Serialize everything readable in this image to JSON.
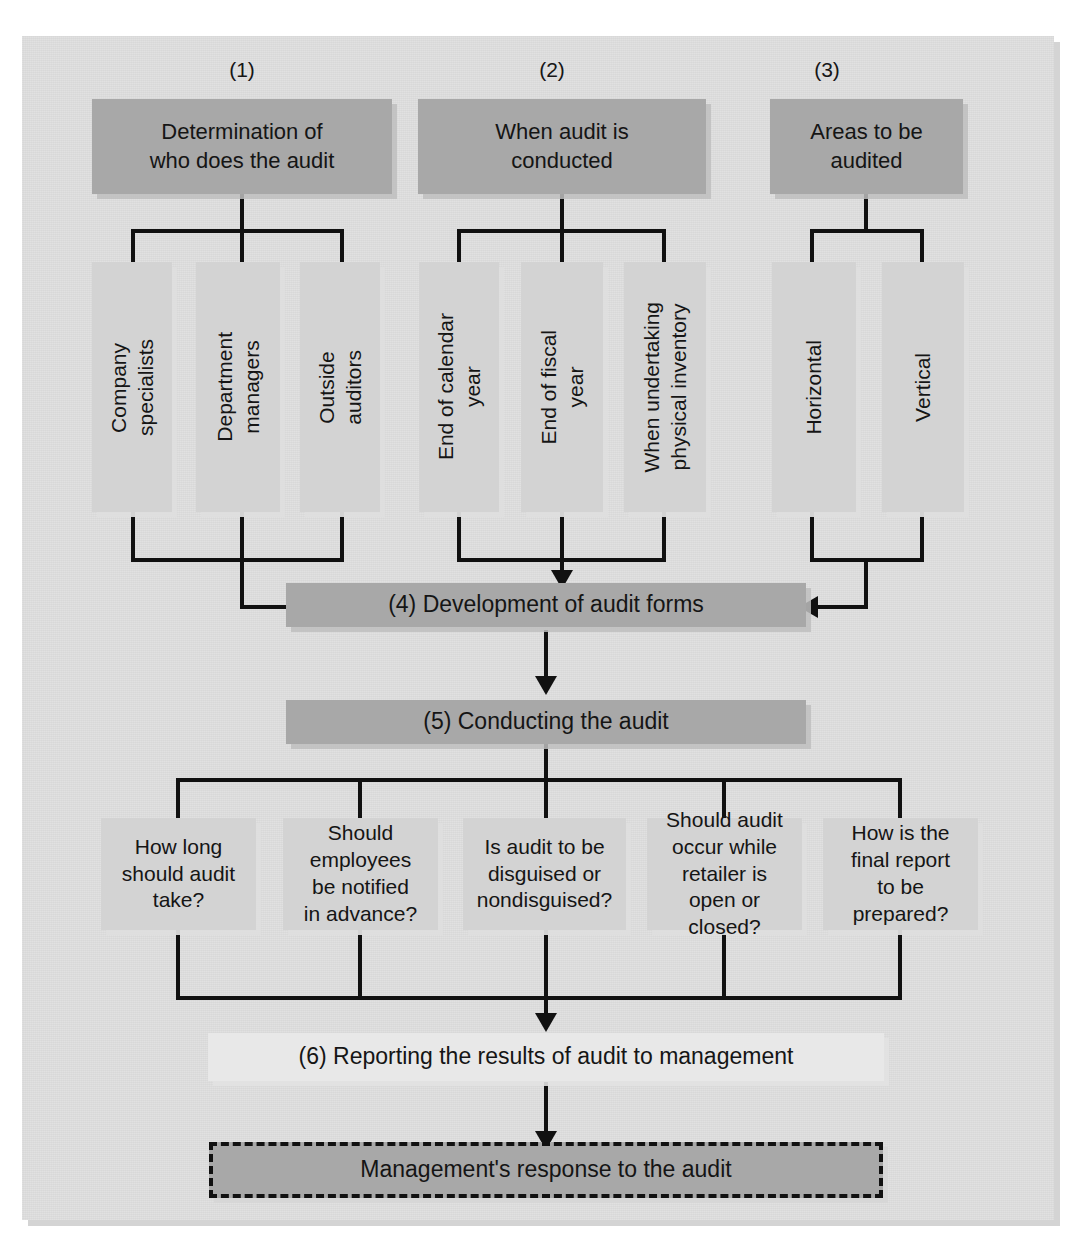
{
  "figure": {
    "background_color": "#dcdcdc",
    "box_dark_color": "#a8a8a8",
    "box_light_color": "#d3d3d3",
    "box_pale_color": "#e8e8e8",
    "line_color": "#111111"
  },
  "column_numbers": [
    {
      "label": "(1)"
    },
    {
      "label": "(2)"
    },
    {
      "label": "(3)"
    }
  ],
  "top_boxes": [
    {
      "number": "(1)",
      "label": "Determination of\nwho does the audit"
    },
    {
      "number": "(2)",
      "label": "When audit is\nconducted"
    },
    {
      "number": "(3)",
      "label": "Areas to be\naudited"
    }
  ],
  "branch_boxes": {
    "column_1": [
      {
        "label": "Company\nspecialists"
      },
      {
        "label": "Department\nmanagers"
      },
      {
        "label": "Outside\nauditors"
      }
    ],
    "column_2": [
      {
        "label": "End of calendar\nyear"
      },
      {
        "label": "End of fiscal\nyear"
      },
      {
        "label": "When undertaking\nphysical inventory"
      }
    ],
    "column_3": [
      {
        "label": "Horizontal"
      },
      {
        "label": "Vertical"
      }
    ]
  },
  "step_4": {
    "label": "(4) Development of audit forms"
  },
  "step_5": {
    "label": "(5) Conducting the audit"
  },
  "question_boxes": [
    {
      "label": "How long\nshould audit\ntake?"
    },
    {
      "label": "Should\nemployees\nbe notified\nin advance?"
    },
    {
      "label": "Is audit to be\ndisguised or\nnondisguised?"
    },
    {
      "label": "Should audit\noccur while\nretailer is\nopen or\nclosed?"
    },
    {
      "label": "How is the\nfinal report\nto be\nprepared?"
    }
  ],
  "step_6": {
    "label": "(6) Reporting the results of audit to management"
  },
  "step_7": {
    "label": "Management's response to the audit"
  }
}
